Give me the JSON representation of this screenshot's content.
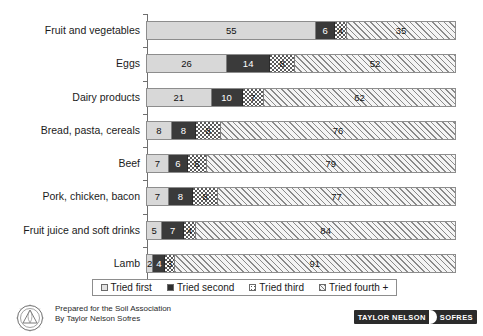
{
  "chart_data": {
    "type": "bar",
    "orientation": "horizontal",
    "stacked": true,
    "title": "",
    "xlabel": "",
    "ylabel": "",
    "xlim": [
      0,
      100
    ],
    "grid": false,
    "legend_position": "bottom",
    "categories": [
      "Fruit and vegetables",
      "Eggs",
      "Dairy products",
      "Bread, pasta, cereals",
      "Beef",
      "Pork, chicken, bacon",
      "Fruit juice and soft drinks",
      "Lamb"
    ],
    "series": [
      {
        "name": "Tried first",
        "values": [
          55,
          26,
          21,
          8,
          7,
          7,
          5,
          2
        ]
      },
      {
        "name": "Tried second",
        "values": [
          6,
          14,
          10,
          8,
          6,
          8,
          7,
          4
        ]
      },
      {
        "name": "Tried third",
        "values": [
          4,
          8,
          7,
          8,
          6,
          8,
          4,
          3
        ]
      },
      {
        "name": "Tried fourth +",
        "values": [
          35,
          52,
          62,
          76,
          79,
          77,
          84,
          91
        ]
      }
    ]
  },
  "legend": {
    "items": [
      {
        "label": "Tried first"
      },
      {
        "label": "Tried second"
      },
      {
        "label": "Tried third"
      },
      {
        "label": "Tried fourth +"
      }
    ]
  },
  "footer": {
    "credit_line1": "Prepared for the Soil Association",
    "credit_line2": "By Taylor Nelson Sofres",
    "logo_left": "TAYLOR NELSON",
    "logo_right": "SOFRES"
  }
}
